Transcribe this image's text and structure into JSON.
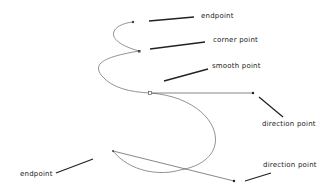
{
  "labels": {
    "endpoint_top": "endpoint",
    "corner_point": "corner point",
    "smooth_point": "smooth point",
    "direction_point_right": "direction point",
    "endpoint_bottom": "endpoint",
    "direction_point_bottom": "direction point"
  },
  "colors": {
    "curve": "#777777",
    "leader": "#222222",
    "text": "#222222"
  }
}
